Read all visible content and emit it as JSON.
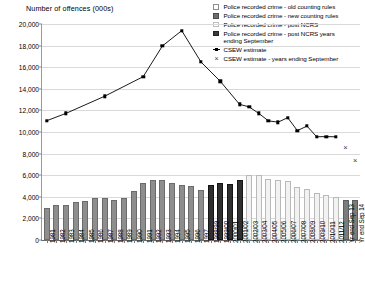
{
  "chart_data": {
    "type": "bar",
    "title": "Number of offences (000s)",
    "ylabel": "Number of offences (000s)",
    "xlabel": "",
    "ylim": [
      0,
      20000
    ],
    "ytick_step": 2000,
    "yticks": [
      "0",
      "2,000",
      "4,000",
      "6,000",
      "8,000",
      "10,000",
      "12,000",
      "14,000",
      "16,000",
      "18,000",
      "20,000"
    ],
    "grid": true,
    "legend_position": "top-right",
    "categories": [
      "1981",
      "1982",
      "1983",
      "1984",
      "1985",
      "1986",
      "1987",
      "1988",
      "1989",
      "1990",
      "1991",
      "1992",
      "1993",
      "1994",
      "1995",
      "1996",
      "1997",
      "1998/99",
      "1999/00",
      "2000/01",
      "2001/02",
      "2002/03",
      "2003/04",
      "2004/05",
      "2005/06",
      "2006/07",
      "2007/08",
      "2008/09",
      "2009/10",
      "2010/11",
      "2011/12",
      "Yr end Sep 13",
      "Yr end Sep 14"
    ],
    "series": [
      {
        "name": "Police recorded crime - old counting rules",
        "color": "#8e8e8e",
        "values": [
          2964,
          3262,
          3247,
          3499,
          3612,
          3847,
          3892,
          3716,
          3870,
          4544,
          5276,
          5592,
          5527,
          5253,
          5101,
          5036,
          4598,
          null,
          null,
          null,
          null,
          null,
          null,
          null,
          null,
          null,
          null,
          null,
          null,
          null,
          null,
          null,
          null
        ]
      },
      {
        "name": "Police recorded crime - new counting rules",
        "color": "#2e2e2e",
        "values": [
          null,
          null,
          null,
          null,
          null,
          null,
          null,
          null,
          null,
          null,
          null,
          null,
          null,
          null,
          null,
          null,
          null,
          5109,
          5301,
          5171,
          5525,
          null,
          null,
          null,
          null,
          null,
          null,
          null,
          null,
          null,
          null,
          null,
          null
        ]
      },
      {
        "name": "Police recorded crime - post NCRS",
        "color": "#f2f2f2",
        "values": [
          null,
          null,
          null,
          null,
          null,
          null,
          null,
          null,
          null,
          null,
          null,
          null,
          null,
          null,
          null,
          null,
          null,
          null,
          null,
          null,
          null,
          5975,
          6014,
          5637,
          5555,
          5428,
          4951,
          4703,
          4338,
          4151,
          4024,
          null,
          null
        ]
      },
      {
        "name": "Police recorded crime - post NCRS years ending September",
        "color": "#7c7c7c",
        "values": [
          null,
          null,
          null,
          null,
          null,
          null,
          null,
          null,
          null,
          null,
          null,
          null,
          null,
          null,
          null,
          null,
          null,
          null,
          null,
          null,
          null,
          null,
          null,
          null,
          null,
          null,
          null,
          null,
          null,
          null,
          null,
          3720,
          3744
        ]
      }
    ],
    "line_series": [
      {
        "name": "CSEW estimate",
        "marker": "square",
        "color": "#000000",
        "points": [
          {
            "x": "1981",
            "y": 11047
          },
          {
            "x": "1983",
            "y": 11730
          },
          {
            "x": "1987",
            "y": 13311
          },
          {
            "x": "1991",
            "y": 15123
          },
          {
            "x": "1993",
            "y": 17973
          },
          {
            "x": "1995",
            "y": 19384
          },
          {
            "x": "1997",
            "y": 16482
          },
          {
            "x": "1999/00",
            "y": 14695
          },
          {
            "x": "2001/02",
            "y": 12565
          },
          {
            "x": "2002/03",
            "y": 12323
          },
          {
            "x": "2003/04",
            "y": 11718
          },
          {
            "x": "2004/05",
            "y": 11030
          },
          {
            "x": "2005/06",
            "y": 10912
          },
          {
            "x": "2006/07",
            "y": 11326
          },
          {
            "x": "2007/08",
            "y": 10128
          },
          {
            "x": "2008/09",
            "y": 10546
          },
          {
            "x": "2009/10",
            "y": 9559
          },
          {
            "x": "2010/11",
            "y": 9572
          },
          {
            "x": "2011/12",
            "y": 9556
          }
        ]
      },
      {
        "name": "CSEW estimate - years ending September",
        "marker": "x",
        "color": "#3a3a3a",
        "points": [
          {
            "x": "Yr end Sep 13",
            "y": 8505
          },
          {
            "x": "Yr end Sep 14",
            "y": 7300
          }
        ]
      }
    ],
    "legend": [
      {
        "label": "Police recorded crime - old counting rules",
        "marker": "swatch-outline-grey"
      },
      {
        "label": "Police recorded crime - new counting rules",
        "marker": "swatch-filled-dark"
      },
      {
        "label": "Police recorded crime - post NCRS",
        "marker": "swatch-outline-light"
      },
      {
        "label": "Police recorded crime - post NCRS years\nending September",
        "marker": "swatch-filled-black"
      },
      {
        "label": "CSEW estimate",
        "marker": "line-square"
      },
      {
        "label": "CSEW estimate - years ending September",
        "marker": "x"
      }
    ]
  }
}
